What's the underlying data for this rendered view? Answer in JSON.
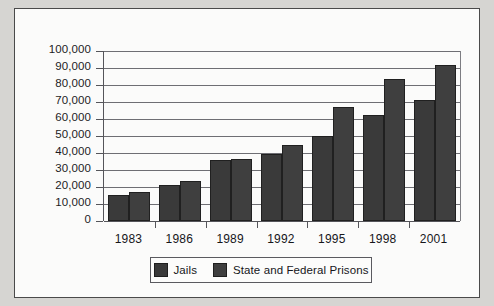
{
  "chart_data": {
    "type": "bar",
    "title": "",
    "subtitle": "",
    "xlabel": "",
    "ylabel": "",
    "categories": [
      "1983",
      "1986",
      "1989",
      "1992",
      "1995",
      "1998",
      "2001"
    ],
    "series": [
      {
        "name": "Jails",
        "color": "#3a3a3a",
        "values": [
          15500,
          21000,
          36000,
          39500,
          50200,
          62500,
          71300
        ]
      },
      {
        "name": "State and Federal Prisons",
        "color": "#3f3f3f",
        "values": [
          17000,
          23500,
          36300,
          44500,
          67300,
          83500,
          92000
        ]
      }
    ],
    "ylim": [
      0,
      100000
    ],
    "ytick_values": [
      0,
      10000,
      20000,
      30000,
      40000,
      50000,
      60000,
      70000,
      80000,
      90000,
      100000
    ],
    "ytick_labels": [
      "0",
      "10,000",
      "20,000",
      "30,000",
      "40,000",
      "50,000",
      "60,000",
      "70,000",
      "80,000",
      "90,000",
      "100,000"
    ],
    "grid": true,
    "grid_axis": "y",
    "legend_position": "bottom",
    "legend": [
      "Jails",
      "State and Federal Prisons"
    ]
  },
  "figure": {
    "background_color": "#fbfbfa",
    "page_background_color": "#d6d5d2",
    "border_color": "#4a4a4a",
    "axis_color": "#55555a",
    "gridline_color": "#6e6e73",
    "text_color": "#16161a"
  },
  "legend_box": {
    "entries": [
      {
        "label": "Jails",
        "swatch_color": "#3a3a3a"
      },
      {
        "label": "State and Federal Prisons",
        "swatch_color": "#3f3f3f"
      }
    ]
  }
}
